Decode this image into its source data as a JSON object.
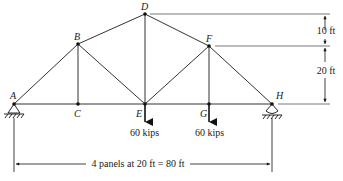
{
  "diagram": {
    "type": "truss",
    "nodes": [
      {
        "id": "A",
        "label": "A",
        "x": 14,
        "y": 104,
        "lx": 10,
        "ly": 99
      },
      {
        "id": "B",
        "label": "B",
        "x": 78,
        "y": 44,
        "lx": 74,
        "ly": 40
      },
      {
        "id": "C",
        "label": "C",
        "x": 78,
        "y": 104,
        "lx": 74,
        "ly": 117
      },
      {
        "id": "D",
        "label": "D",
        "x": 145,
        "y": 14,
        "lx": 141,
        "ly": 10
      },
      {
        "id": "E",
        "label": "E",
        "x": 145,
        "y": 104,
        "lx": 136,
        "ly": 117
      },
      {
        "id": "F",
        "label": "F",
        "x": 209,
        "y": 46,
        "lx": 206,
        "ly": 42
      },
      {
        "id": "G",
        "label": "G",
        "x": 209,
        "y": 104,
        "lx": 200,
        "ly": 117
      },
      {
        "id": "H",
        "label": "H",
        "x": 272,
        "y": 104,
        "lx": 276,
        "ly": 99
      }
    ],
    "members": [
      [
        "A",
        "B"
      ],
      [
        "B",
        "D"
      ],
      [
        "D",
        "F"
      ],
      [
        "F",
        "H"
      ],
      [
        "A",
        "C"
      ],
      [
        "C",
        "E"
      ],
      [
        "E",
        "G"
      ],
      [
        "G",
        "H"
      ],
      [
        "B",
        "C"
      ],
      [
        "B",
        "E"
      ],
      [
        "D",
        "E"
      ],
      [
        "E",
        "F"
      ],
      [
        "F",
        "G"
      ]
    ],
    "loads": [
      {
        "node": "E",
        "label": "60 kips",
        "tx": 131,
        "ty": 134
      },
      {
        "node": "G",
        "label": "60 kips",
        "tx": 195,
        "ty": 134
      }
    ],
    "supports": [
      {
        "node": "A",
        "type": "pin"
      },
      {
        "node": "H",
        "type": "roller"
      }
    ],
    "dimensions": {
      "vertical": [
        {
          "label": "10 ft",
          "from": "D",
          "to": "F"
        },
        {
          "label": "20 ft",
          "from": "F",
          "to": "H"
        }
      ],
      "horizontal": {
        "label": "4 panels at 20 ft = 80 ft"
      }
    }
  }
}
